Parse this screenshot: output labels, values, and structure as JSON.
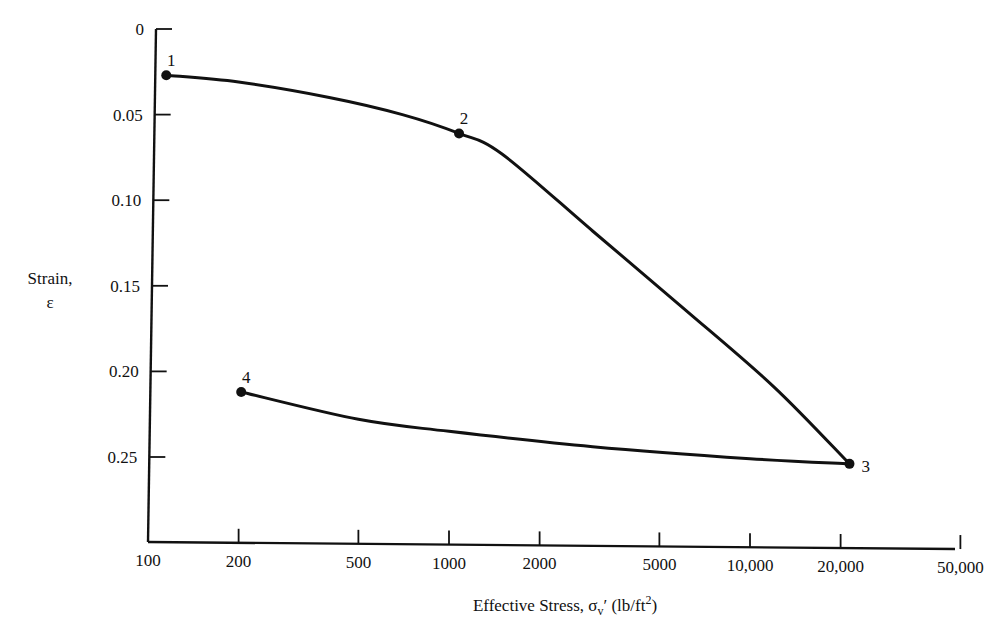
{
  "chart_data": {
    "type": "line",
    "title": "",
    "xlabel": "Effective Stress, σv′ (lb/ft²)",
    "xlabel_parts": {
      "main": "Effective Stress, σ",
      "sub": "v",
      "prime": "′ (lb/ft",
      "sup": "2",
      "close": ")"
    },
    "ylabel": "Strain, ε",
    "ylabel_lines": [
      "Strain,",
      "ε"
    ],
    "x_scale": "log",
    "y_inverted": true,
    "xlim": [
      100,
      50000
    ],
    "ylim": [
      0,
      0.3
    ],
    "x_ticks": [
      100,
      200,
      500,
      1000,
      2000,
      5000,
      10000,
      20000,
      50000
    ],
    "x_tick_labels": [
      "100",
      "200",
      "500",
      "1000",
      "2000",
      "5000",
      "10,000",
      "20,000",
      "50,000"
    ],
    "y_ticks": [
      0,
      0.05,
      0.1,
      0.15,
      0.2,
      0.25
    ],
    "y_tick_labels": [
      "0",
      "0.05",
      "0.10",
      "0.15",
      "0.20",
      "0.25"
    ],
    "grid": false,
    "legend": null,
    "points": [
      {
        "label": "1",
        "x": 115,
        "y": 0.027
      },
      {
        "label": "2",
        "x": 1080,
        "y": 0.061
      },
      {
        "label": "3",
        "x": 21400,
        "y": 0.254
      },
      {
        "label": "4",
        "x": 204,
        "y": 0.212
      }
    ],
    "series": [
      {
        "name": "Loading (1→2→3)",
        "x": [
          115,
          200,
          400,
          700,
          1080,
          1500,
          3000,
          6000,
          12000,
          21400
        ],
        "y": [
          0.027,
          0.031,
          0.04,
          0.05,
          0.061,
          0.073,
          0.118,
          0.163,
          0.209,
          0.254
        ]
      },
      {
        "name": "Unloading (3→4)",
        "x": [
          21400,
          10000,
          3000,
          1000,
          500,
          204
        ],
        "y": [
          0.254,
          0.251,
          0.244,
          0.235,
          0.228,
          0.212
        ]
      }
    ]
  },
  "colors": {
    "ink": "#111111",
    "background": "#ffffff"
  }
}
